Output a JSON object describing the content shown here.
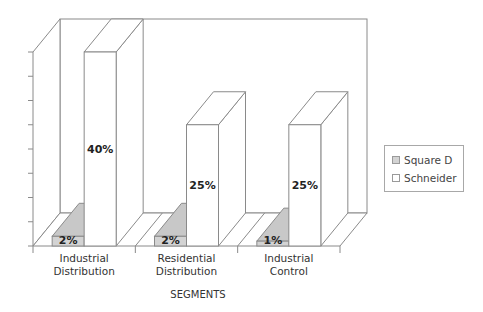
{
  "chart_data": {
    "type": "bar",
    "style": "3d-clustered-column",
    "title": "",
    "xlabel": "SEGMENTS",
    "ylabel": "",
    "categories": [
      "Industrial Distribution",
      "Residential Distribution",
      "Industrial Control"
    ],
    "category_lines": [
      [
        "Industrial",
        "Distribution"
      ],
      [
        "Residential",
        "Distribution"
      ],
      [
        "Industrial",
        "Control"
      ]
    ],
    "series": [
      {
        "name": "Square D",
        "values": [
          2,
          2,
          1
        ],
        "labels": [
          "2%",
          "2%",
          "1%"
        ],
        "color": "#d3d3d3"
      },
      {
        "name": "Schneider",
        "values": [
          40,
          25,
          25
        ],
        "labels": [
          "40%",
          "25%",
          "25%"
        ],
        "color": "#ffffff"
      }
    ],
    "ylim": [
      0,
      40
    ],
    "y_tick_count": 8,
    "y_tick_labels_visible": false,
    "grid": false,
    "legend_position": "right"
  },
  "legend": {
    "items": [
      {
        "label": "Square D",
        "color": "#d3d3d3"
      },
      {
        "label": "Schneider",
        "color": "#ffffff"
      }
    ]
  },
  "axis": {
    "x_title": "SEGMENTS"
  }
}
